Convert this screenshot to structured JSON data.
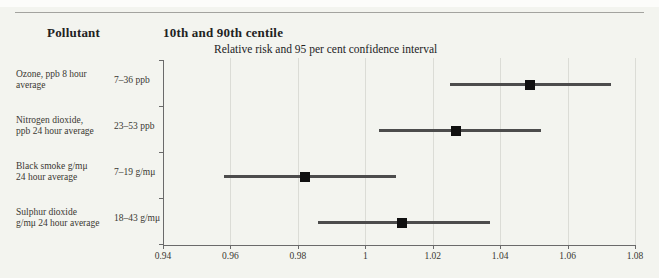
{
  "header": {
    "pollutant": "Pollutant",
    "centile": "10th and 90th centile"
  },
  "colors": {
    "background": "#f3f4ef",
    "ci_line": "#4c4c4c",
    "marker": "#101010",
    "grid": "#dbdcd6",
    "axis": "#6a6a6a",
    "text": "#3a3832",
    "heading": "#22221e",
    "rule": "#a3a39f"
  },
  "chart_data": {
    "type": "forest",
    "title": "Relative risk and 95 per cent confidence interval",
    "column_headers": [
      "Pollutant",
      "10th and 90th centile"
    ],
    "xlim": [
      0.94,
      1.08
    ],
    "ticks": [
      0.94,
      0.96,
      0.98,
      1.0,
      1.02,
      1.04,
      1.06,
      1.08
    ],
    "tick_labels": [
      "0.94",
      "0.96",
      "0.98",
      "1",
      "1.02",
      "1.04",
      "1.06",
      "1.08"
    ],
    "grid": true,
    "rows": [
      {
        "pollutant": [
          "Ozone, ppb 8 hour average"
        ],
        "centile_range": "7–36 ppb",
        "relative_risk": 1.049,
        "ci_low": 1.025,
        "ci_high": 1.073
      },
      {
        "pollutant": [
          "Nitrogen dioxide,",
          "ppb 24 hour average"
        ],
        "centile_range": "23–53 ppb",
        "relative_risk": 1.027,
        "ci_low": 1.004,
        "ci_high": 1.052
      },
      {
        "pollutant": [
          "Black smoke g/mμ",
          "24 hour average"
        ],
        "centile_range": "7–19 g/mμ",
        "relative_risk": 0.982,
        "ci_low": 0.958,
        "ci_high": 1.009
      },
      {
        "pollutant": [
          "Sulphur dioxide",
          "g/mμ 24 hour average"
        ],
        "centile_range": "18–43 g/mμ",
        "relative_risk": 1.011,
        "ci_low": 0.986,
        "ci_high": 1.037
      }
    ]
  }
}
